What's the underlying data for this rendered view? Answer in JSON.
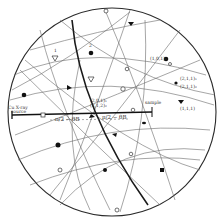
{
  "diagram": {
    "type": "stereographic-projection",
    "colors": {
      "ink": "#2a2a2a",
      "faint": "#8a8a8a",
      "background": "#ffffff"
    },
    "labels": {
      "source": "Cu X-ray source",
      "source_line1": "Cu X-ray",
      "source_line2": "source",
      "angle_left": "π/2 − θB",
      "angle_right": "π/2 − θB",
      "pole_center_1": "(2,0,1)₁",
      "pole_center_2": "(2,1,2)₂",
      "pole_upper_right": "(1,0,1)₁",
      "pole_right_1": "(2,1,1)₁",
      "pole_right_2": "(2,1,1)₂",
      "pole_right_3": "(1,1,1)",
      "sample": "sample",
      "num_1": "1",
      "num_2": "2"
    }
  }
}
